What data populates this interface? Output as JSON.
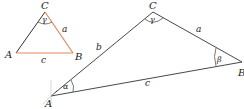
{
  "diagram": {
    "title": "",
    "colors": {
      "line": "#333333",
      "accent": "#e0895a",
      "faint": "#bbbbbb",
      "text": "#222222"
    },
    "small_triangle": {
      "vertices": {
        "A": {
          "label": "A",
          "x": 16,
          "y": 53
        },
        "B": {
          "label": "B",
          "x": 73,
          "y": 53
        },
        "C": {
          "label": "C",
          "x": 45,
          "y": 12
        }
      },
      "sides": {
        "a": {
          "label": "a",
          "highlight": true
        },
        "b": {
          "label": "",
          "highlight": false
        },
        "c": {
          "label": "c",
          "highlight": true
        }
      },
      "angles": {
        "gamma": {
          "label": "γ",
          "at": "C"
        }
      }
    },
    "large_triangle": {
      "vertices": {
        "A": {
          "label": "A",
          "x": 51,
          "y": 96
        },
        "B": {
          "label": "B",
          "x": 242,
          "y": 62
        },
        "C": {
          "label": "C",
          "x": 153,
          "y": 12
        }
      },
      "sides": {
        "a": {
          "label": "a"
        },
        "b": {
          "label": "b"
        },
        "c": {
          "label": "c"
        }
      },
      "angles": {
        "alpha": {
          "label": "α",
          "at": "A"
        },
        "beta": {
          "label": "β",
          "at": "B"
        },
        "gamma": {
          "label": "γ",
          "at": "C"
        }
      }
    }
  }
}
